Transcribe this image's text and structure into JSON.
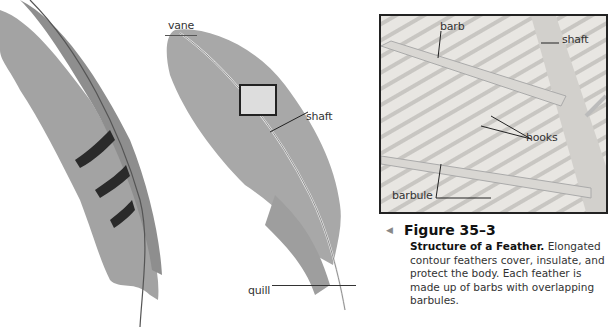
{
  "figure": {
    "number": "Figure 35–3",
    "caption_title": "Structure of a Feather.",
    "caption_text": "Elongated contour feathers cover, insulate, and protect the body. Each feather is made up of barbs with overlapping barbules."
  },
  "labels": {
    "vane": "vane",
    "shaft_main": "shaft",
    "quill": "quill",
    "barb": "barb",
    "shaft_inset": "shaft",
    "hooks": "hooks",
    "barbule": "barbule"
  },
  "colors": {
    "feather_gray": "#9a9a9a",
    "band_dark": "#2a2a2a",
    "inset_border": "#222222",
    "text": "#333333"
  }
}
